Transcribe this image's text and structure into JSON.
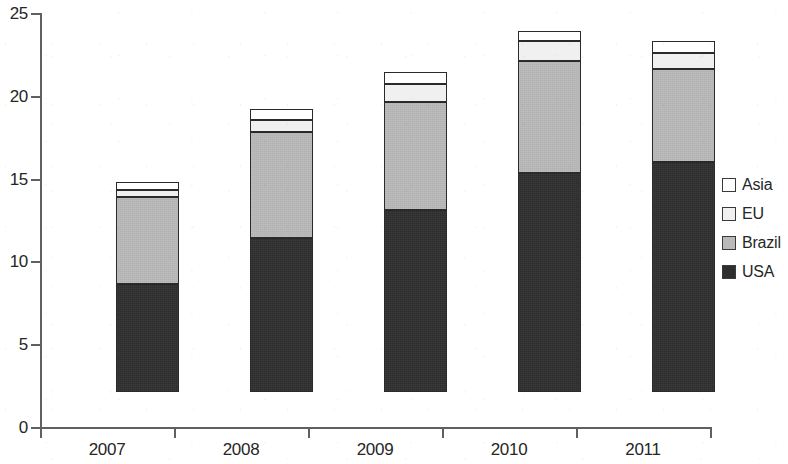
{
  "chart_data": {
    "type": "bar",
    "subtype": "stacked-bar",
    "title": "",
    "subtitle": "",
    "xlabel": "",
    "ylabel": "",
    "categories": [
      "2007",
      "2008",
      "2009",
      "2010",
      "2011"
    ],
    "series": [
      {
        "name": "USA",
        "values": [
          6.5,
          9.3,
          11.0,
          13.2,
          13.9
        ],
        "color": "#2e2e2e"
      },
      {
        "name": "Brazil",
        "values": [
          5.3,
          6.4,
          6.5,
          6.8,
          5.6
        ],
        "color": "#b9b9b9"
      },
      {
        "name": "EU",
        "values": [
          0.4,
          0.7,
          1.1,
          1.2,
          1.0
        ],
        "color": "#f0f0f0"
      },
      {
        "name": "Asia",
        "values": [
          0.5,
          0.7,
          0.7,
          0.6,
          0.7
        ],
        "color": "#ffffff"
      }
    ],
    "stack_order_bottom_to_top": [
      "USA",
      "Brazil",
      "EU",
      "Asia"
    ],
    "totals": [
      12.7,
      17.1,
      19.3,
      21.8,
      21.2
    ],
    "ylim": [
      0,
      25
    ],
    "ytick_values": [
      0,
      5,
      10,
      15,
      20,
      25
    ],
    "ytick_labels": [
      "0",
      "5",
      "10",
      "15",
      "20",
      "25"
    ],
    "grid": false,
    "legend_position": "right",
    "legend_entries": [
      {
        "label": "Asia",
        "swatch": "#ffffff"
      },
      {
        "label": "EU",
        "swatch": "#f0f0f0"
      },
      {
        "label": "Brazil",
        "swatch": "#b9b9b9"
      },
      {
        "label": "USA",
        "swatch": "#2e2e2e"
      }
    ]
  },
  "axes": {
    "y_ticks": [
      {
        "label": "25",
        "value": 25
      },
      {
        "label": "20",
        "value": 20
      },
      {
        "label": "15",
        "value": 15
      },
      {
        "label": "10",
        "value": 10
      },
      {
        "label": "5",
        "value": 5
      },
      {
        "label": "0",
        "value": 0
      }
    ],
    "x_ticks": [
      {
        "label": "2007"
      },
      {
        "label": "2008"
      },
      {
        "label": "2009"
      },
      {
        "label": "2010"
      },
      {
        "label": "2011"
      }
    ]
  }
}
